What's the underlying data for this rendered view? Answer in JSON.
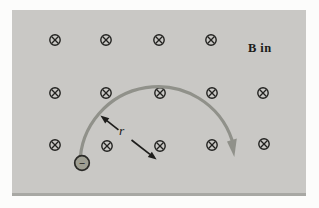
{
  "figure": {
    "field_label": "B in",
    "radius_label": "r",
    "charge_sign": "−",
    "colors": {
      "page_background": "#fcfcfb",
      "panel_background": "#c9c8c5",
      "panel_bottom_edge": "#a8a8a4",
      "field_symbol": "#232321",
      "path_arc": "#90918a",
      "radius_arrow": "#1d1d1b",
      "charge_fill": "#9e9e92",
      "charge_stroke": "#2a2a27",
      "label_text": "#1c1c1a"
    },
    "field_symbols": [
      {
        "x": 55,
        "y": 40
      },
      {
        "x": 106,
        "y": 40
      },
      {
        "x": 159,
        "y": 40
      },
      {
        "x": 211,
        "y": 40
      },
      {
        "x": 55,
        "y": 93
      },
      {
        "x": 106,
        "y": 93
      },
      {
        "x": 160,
        "y": 93
      },
      {
        "x": 212,
        "y": 93
      },
      {
        "x": 263,
        "y": 93
      },
      {
        "x": 55,
        "y": 145
      },
      {
        "x": 107,
        "y": 146
      },
      {
        "x": 160,
        "y": 146
      },
      {
        "x": 212,
        "y": 145
      },
      {
        "x": 264,
        "y": 144
      }
    ],
    "charge_position": {
      "x": 82,
      "y": 163
    }
  }
}
